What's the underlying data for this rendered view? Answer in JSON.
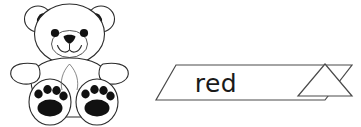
{
  "page": {
    "background_color": "#ffffff"
  },
  "illustration": {
    "name": "teddy-bear",
    "description": "Line-art teddy bear sitting with arms out and two paws showing pads",
    "outline_color": "#2b2b2b",
    "fill_color": "#ffffff",
    "detail_color": "#111111",
    "parts": {
      "ear_left": "ear-left",
      "ear_right": "ear-right",
      "head": "head",
      "muzzle": "muzzle",
      "nose": "nose",
      "mouth": "mouth",
      "eye_left": "eye-left",
      "eye_right": "eye-right",
      "body": "body",
      "arm_left": "arm-left",
      "arm_right": "arm-right",
      "foot_left": "foot-left",
      "foot_right": "foot-right",
      "paw_pads": "paw-pads"
    }
  },
  "banner": {
    "word": "red",
    "shape": "ribbon-banner-with-triangle-tail",
    "stroke_color": "#4a4a4a",
    "fill_color": "#ffffff",
    "text_color": "#1a1a1a"
  }
}
